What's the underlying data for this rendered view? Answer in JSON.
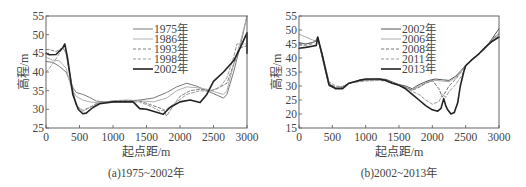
{
  "chart_data": [
    {
      "type": "line",
      "title": "",
      "caption": "(a)1975~2002年",
      "xlabel": "起点距/m",
      "ylabel": "高程/m",
      "xlim": [
        0,
        3000
      ],
      "ylim": [
        25,
        55
      ],
      "xticks": [
        0,
        500,
        1000,
        1500,
        2000,
        2500,
        3000
      ],
      "yticks": [
        25,
        30,
        35,
        40,
        45,
        50,
        55
      ],
      "grid": false,
      "legend_position": "upper center",
      "series": [
        {
          "name": "1975年",
          "style": "solid",
          "color": "#7a7a7a",
          "width": 1.0,
          "x": [
            0,
            100,
            200,
            300,
            380,
            450,
            550,
            650,
            750,
            900,
            1000,
            1200,
            1400,
            1600,
            1800,
            1950,
            2100,
            2250,
            2400,
            2550,
            2650,
            2700,
            2800,
            2900,
            3000
          ],
          "y": [
            42.8,
            42.6,
            41.5,
            40,
            36.5,
            34.5,
            34,
            33.2,
            32.2,
            32,
            32,
            32.2,
            32.5,
            33,
            34.5,
            36,
            37,
            36.2,
            35,
            33.8,
            33,
            34,
            40,
            47,
            55
          ]
        },
        {
          "name": "1986年",
          "style": "solid",
          "color": "#b0b0b0",
          "width": 1.0,
          "x": [
            0,
            100,
            200,
            300,
            380,
            450,
            550,
            650,
            750,
            900,
            1000,
            1200,
            1400,
            1600,
            1800,
            1950,
            2100,
            2250,
            2400,
            2550,
            2650,
            2700,
            2800,
            2900,
            3000
          ],
          "y": [
            44,
            43.2,
            43,
            41,
            35.5,
            33.5,
            32.5,
            32,
            31.8,
            32,
            32.3,
            32.5,
            32.3,
            32,
            33,
            35,
            36,
            35.8,
            35.4,
            34.5,
            34,
            35,
            42,
            48,
            55
          ]
        },
        {
          "name": "1993年",
          "style": "dashed",
          "color": "#808080",
          "width": 1.0,
          "x": [
            0,
            50,
            150,
            250,
            300,
            380,
            450,
            550,
            650,
            750,
            900,
            1000,
            1200,
            1400,
            1600,
            1750,
            1800,
            1900,
            2000,
            2150,
            2300,
            2450,
            2550,
            2700,
            2800,
            2900,
            3000
          ],
          "y": [
            46,
            46,
            45.5,
            46.5,
            45,
            37,
            31,
            29.5,
            30.5,
            31.5,
            32,
            32.2,
            32.4,
            32.2,
            31,
            30,
            28.2,
            31,
            33.5,
            35,
            35.4,
            35,
            35.5,
            37,
            42,
            46.5,
            47
          ]
        },
        {
          "name": "1998年",
          "style": "dashed",
          "color": "#999999",
          "width": 1.0,
          "x": [
            0,
            50,
            150,
            250,
            300,
            380,
            450,
            550,
            650,
            750,
            900,
            1000,
            1200,
            1400,
            1600,
            1700,
            1800,
            1950,
            2100,
            2300,
            2450,
            2600,
            2700,
            2800,
            2850,
            2950,
            3000
          ],
          "y": [
            40,
            41,
            43.5,
            46.5,
            45,
            36,
            31,
            29.8,
            30.5,
            31.5,
            32,
            32,
            32,
            32,
            30.5,
            29.5,
            30,
            32,
            34,
            35,
            34.8,
            36,
            38.5,
            44,
            47.5,
            47.5,
            47.5
          ]
        },
        {
          "name": "2002年",
          "style": "solid",
          "color": "#222222",
          "width": 1.6,
          "x": [
            0,
            50,
            150,
            250,
            280,
            320,
            400,
            480,
            550,
            600,
            700,
            800,
            1000,
            1200,
            1300,
            1400,
            1500,
            1600,
            1750,
            1850,
            2000,
            2150,
            2300,
            2400,
            2500,
            2650,
            2800,
            2900,
            3000,
            3000
          ],
          "y": [
            45,
            44.6,
            44.7,
            46.5,
            47.5,
            44,
            34,
            30,
            28.8,
            29,
            30.5,
            31.5,
            32,
            32,
            32,
            30.2,
            30,
            29.5,
            28.7,
            30.5,
            32,
            32.5,
            31.8,
            34,
            37.5,
            40,
            43,
            46.5,
            50.5,
            45
          ]
        }
      ]
    },
    {
      "type": "line",
      "title": "",
      "caption": "(b)2002~2013年",
      "xlabel": "起点距/m",
      "ylabel": "高程/m",
      "xlim": [
        0,
        3000
      ],
      "ylim": [
        15,
        55
      ],
      "xticks": [
        0,
        500,
        1000,
        1500,
        2000,
        2500,
        3000
      ],
      "yticks": [
        15,
        20,
        25,
        30,
        35,
        40,
        45,
        50,
        55
      ],
      "grid": false,
      "legend_position": "upper center",
      "series": [
        {
          "name": "2002年",
          "style": "solid",
          "color": "#555555",
          "width": 1.0,
          "x": [
            0,
            100,
            200,
            260,
            280,
            350,
            450,
            550,
            650,
            750,
            900,
            1000,
            1200,
            1300,
            1400,
            1500,
            1600,
            1700,
            1800,
            1950,
            2050,
            2150,
            2250,
            2350,
            2450,
            2500,
            2600,
            2700,
            2800,
            2900,
            3000
          ],
          "y": [
            45.5,
            45,
            45.5,
            46,
            47.5,
            40,
            30,
            29.2,
            29.5,
            31,
            32,
            32.3,
            32.5,
            32.4,
            31.5,
            30.5,
            30,
            29,
            30.5,
            32,
            32.5,
            32.2,
            32,
            33.5,
            36,
            37.5,
            39.5,
            41.5,
            43.5,
            47,
            50.5
          ]
        },
        {
          "name": "2006年",
          "style": "solid",
          "color": "#aaaaaa",
          "width": 1.0,
          "x": [
            0,
            100,
            200,
            260,
            280,
            350,
            450,
            550,
            650,
            750,
            900,
            1000,
            1200,
            1300,
            1400,
            1500,
            1600,
            1700,
            1800,
            1950,
            2050,
            2150,
            2250,
            2350,
            2450,
            2500,
            2600,
            2700,
            2800,
            2900,
            3000
          ],
          "y": [
            48.5,
            47.5,
            46.5,
            46,
            47.5,
            40.5,
            30.5,
            29.5,
            29.8,
            31,
            31.8,
            32,
            32.2,
            32,
            31,
            30.3,
            29.5,
            28.5,
            30,
            31.5,
            32,
            31.8,
            31.5,
            33,
            35.8,
            37.2,
            39.5,
            41.5,
            43.5,
            46.5,
            49
          ]
        },
        {
          "name": "2008年",
          "style": "dashed",
          "color": "#777777",
          "width": 1.0,
          "x": [
            0,
            100,
            200,
            260,
            280,
            350,
            450,
            550,
            650,
            750,
            900,
            1000,
            1200,
            1300,
            1400,
            1500,
            1600,
            1700,
            1800,
            1900,
            2000,
            2100,
            2150,
            2200,
            2250,
            2350,
            2450,
            2500,
            2600,
            2700,
            2800,
            2900,
            3000
          ],
          "y": [
            45,
            45,
            45.5,
            46.5,
            47,
            41,
            31,
            29.5,
            29.7,
            31,
            31.8,
            32,
            32.2,
            32,
            31,
            30.3,
            29.5,
            28.5,
            29.5,
            31,
            32,
            29,
            26,
            28,
            30,
            32.5,
            35.5,
            37.2,
            39.5,
            41.5,
            44,
            47,
            48.5
          ]
        },
        {
          "name": "2011年",
          "style": "dashed",
          "color": "#999999",
          "width": 1.0,
          "x": [
            0,
            100,
            200,
            260,
            280,
            350,
            450,
            550,
            650,
            750,
            900,
            1000,
            1200,
            1300,
            1400,
            1500,
            1600,
            1700,
            1800,
            1900,
            2000,
            2100,
            2150,
            2200,
            2250,
            2350,
            2450,
            2500,
            2600,
            2700,
            2800,
            2900,
            3000
          ],
          "y": [
            44.5,
            44.5,
            45,
            46.5,
            47,
            41.5,
            31.5,
            30,
            29.8,
            31,
            31.5,
            31.8,
            32,
            31.8,
            31,
            30.2,
            29.5,
            28,
            27,
            25,
            23.5,
            24.5,
            27,
            26,
            28,
            30.5,
            34,
            37,
            39.5,
            41.5,
            44,
            46.5,
            48
          ]
        },
        {
          "name": "2013年",
          "style": "solid",
          "color": "#222222",
          "width": 1.6,
          "x": [
            0,
            100,
            200,
            260,
            280,
            350,
            450,
            550,
            650,
            750,
            900,
            1000,
            1200,
            1300,
            1400,
            1500,
            1600,
            1700,
            1800,
            1900,
            2000,
            2080,
            2130,
            2170,
            2200,
            2230,
            2280,
            2330,
            2380,
            2420,
            2470,
            2500,
            2600,
            2700,
            2800,
            2900,
            3000
          ],
          "y": [
            43.5,
            43.8,
            44.2,
            44.5,
            47.5,
            41,
            30.5,
            29,
            29,
            31,
            32,
            32.5,
            32.5,
            32,
            31,
            30.3,
            29,
            27,
            25,
            23,
            21.5,
            21,
            22,
            25.5,
            23,
            21.5,
            20,
            20.5,
            24,
            30,
            35,
            37.2,
            39.5,
            41.5,
            44,
            46,
            47.5
          ]
        }
      ]
    }
  ]
}
